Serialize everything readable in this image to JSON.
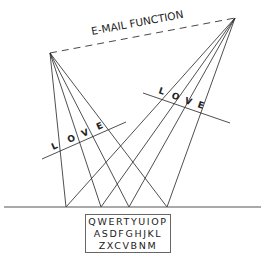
{
  "diagram": {
    "title": "E-MAIL FUNCTION",
    "colors": {
      "line": "#222222",
      "background": "#ffffff",
      "box_border": "#666666"
    },
    "left_apex": {
      "x": 50,
      "y": 53
    },
    "right_apex": {
      "x": 235,
      "y": 18
    },
    "ground_line": {
      "y": 207,
      "x1": 4,
      "x2": 261
    },
    "ground_points_x": [
      66,
      101,
      129,
      167
    ],
    "left_cross_label": {
      "letters": [
        "L",
        "O",
        "V",
        "E"
      ]
    },
    "right_cross_label": {
      "letters": [
        "L",
        "O",
        "V",
        "E"
      ]
    },
    "keyboard": {
      "rows": [
        "QWERTYUIOP",
        "ASDFGHJKL",
        "ZXCVBNM"
      ]
    }
  }
}
